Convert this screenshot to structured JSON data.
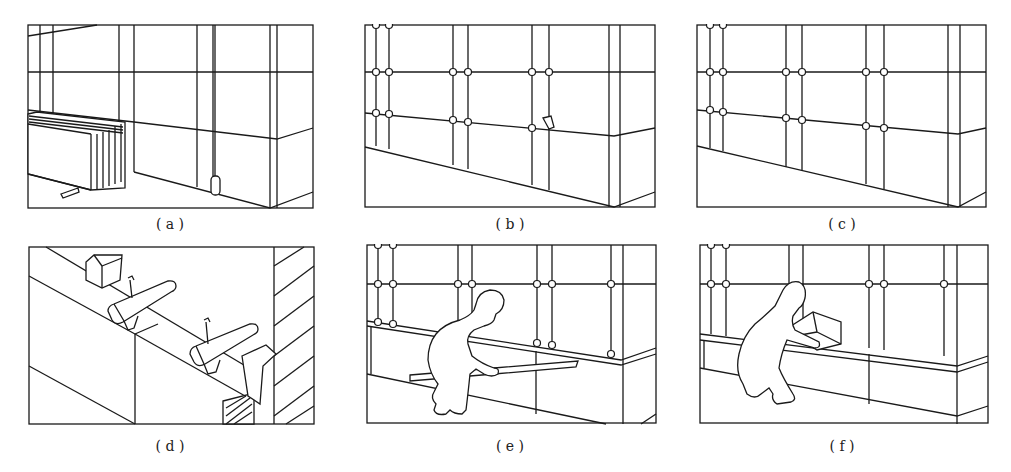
{
  "figure": {
    "panels": [
      {
        "id": "a",
        "caption": "( a )",
        "description": "Wall grid with stacked panels and plumb bob"
      },
      {
        "id": "b",
        "caption": "( b )",
        "description": "Grid with anchor points and one bracket"
      },
      {
        "id": "c",
        "caption": "( c )",
        "description": "Grid with anchor points at intersections"
      },
      {
        "id": "d",
        "caption": "( d )",
        "description": "Detail of panel top edge with clamps and hatched section"
      },
      {
        "id": "e",
        "caption": "( e )",
        "description": "Worker installing horizontal rail"
      },
      {
        "id": "f",
        "caption": "( f )",
        "description": "Worker placing box on finished ledge"
      }
    ]
  },
  "colors": {
    "line": "#1a1a1a",
    "background": "#ffffff"
  }
}
